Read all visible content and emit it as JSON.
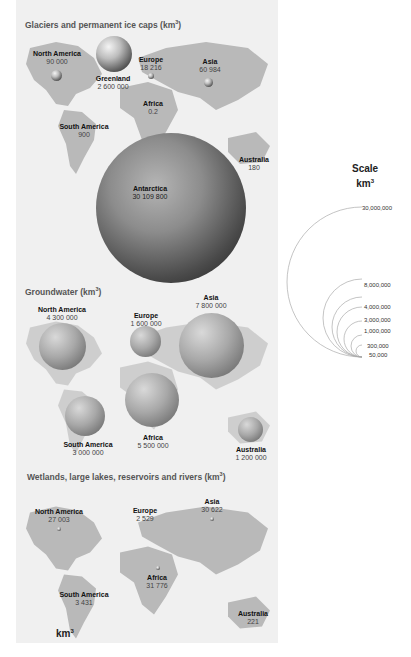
{
  "sections": {
    "glaciers": {
      "title": "Glaciers and permanent ice caps (km",
      "title_sup": "3",
      "title_close": ")",
      "regions": [
        {
          "name": "North America",
          "value": "90 000"
        },
        {
          "name": "Greenland",
          "value": "2 600 000"
        },
        {
          "name": "Europe",
          "value": "18 216"
        },
        {
          "name": "Asia",
          "value": "60 984"
        },
        {
          "name": "Africa",
          "value": "0.2"
        },
        {
          "name": "South America",
          "value": "900"
        },
        {
          "name": "Australia",
          "value": "180"
        },
        {
          "name": "Antarctica",
          "value": "30 109 800"
        }
      ]
    },
    "groundwater": {
      "title": "Groundwater (km",
      "title_sup": "3",
      "title_close": ")",
      "regions": [
        {
          "name": "North America",
          "value": "4 300 000"
        },
        {
          "name": "Europe",
          "value": "1 600 000"
        },
        {
          "name": "Asia",
          "value": "7 800 000"
        },
        {
          "name": "South America",
          "value": "3 000 000"
        },
        {
          "name": "Africa",
          "value": "5 500 000"
        },
        {
          "name": "Australia",
          "value": "1 200 000"
        }
      ]
    },
    "wetlands": {
      "title": "Wetlands, large lakes, reservoirs and rivers (km",
      "title_sup": "3",
      "title_close": ")",
      "regions": [
        {
          "name": "North America",
          "value": "27 003"
        },
        {
          "name": "Europe",
          "value": "2 529"
        },
        {
          "name": "Asia",
          "value": "30 622"
        },
        {
          "name": "Africa",
          "value": "31 776"
        },
        {
          "name": "South America",
          "value": "3 431"
        },
        {
          "name": "Australia",
          "value": "221"
        }
      ],
      "unit": "km",
      "unit_sup": "3"
    }
  },
  "scale": {
    "title": "Scale",
    "unit": "km",
    "unit_sup": "3",
    "labels": [
      "30,000,000",
      "8,000,000",
      "4,000,000",
      "3,000,000",
      "1,000,000",
      "300,000",
      "50,000"
    ]
  }
}
